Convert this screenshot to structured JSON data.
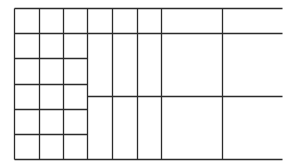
{
  "diagram": {
    "title": "",
    "stroke_color": "#2b2b2b",
    "stroke_width": 1.3,
    "background": "#ffffff",
    "segments": [
      {
        "id": "h-top",
        "x1": 14,
        "y1": 8,
        "x2": 282,
        "y2": 8
      },
      {
        "id": "h-row1",
        "x1": 14,
        "y1": 33,
        "x2": 282,
        "y2": 33
      },
      {
        "id": "h-row2",
        "x1": 14,
        "y1": 58,
        "x2": 87,
        "y2": 58
      },
      {
        "id": "h-row3",
        "x1": 14,
        "y1": 84,
        "x2": 87,
        "y2": 84
      },
      {
        "id": "h-mid",
        "x1": 87,
        "y1": 96,
        "x2": 282,
        "y2": 96
      },
      {
        "id": "h-row4",
        "x1": 14,
        "y1": 109,
        "x2": 87,
        "y2": 109
      },
      {
        "id": "h-row5",
        "x1": 14,
        "y1": 134,
        "x2": 87,
        "y2": 134
      },
      {
        "id": "h-bottom",
        "x1": 14,
        "y1": 159,
        "x2": 282,
        "y2": 159
      },
      {
        "id": "v-left",
        "x1": 14,
        "y1": 8,
        "x2": 14,
        "y2": 159
      },
      {
        "id": "v-col1",
        "x1": 39,
        "y1": 8,
        "x2": 39,
        "y2": 159
      },
      {
        "id": "v-col2",
        "x1": 63,
        "y1": 8,
        "x2": 63,
        "y2": 159
      },
      {
        "id": "v-col3",
        "x1": 87,
        "y1": 8,
        "x2": 87,
        "y2": 159
      },
      {
        "id": "v-col4",
        "x1": 112,
        "y1": 8,
        "x2": 112,
        "y2": 159
      },
      {
        "id": "v-col5",
        "x1": 137,
        "y1": 8,
        "x2": 137,
        "y2": 159
      },
      {
        "id": "v-col6",
        "x1": 161,
        "y1": 8,
        "x2": 161,
        "y2": 159
      },
      {
        "id": "v-col7",
        "x1": 222,
        "y1": 8,
        "x2": 222,
        "y2": 159
      }
    ]
  }
}
